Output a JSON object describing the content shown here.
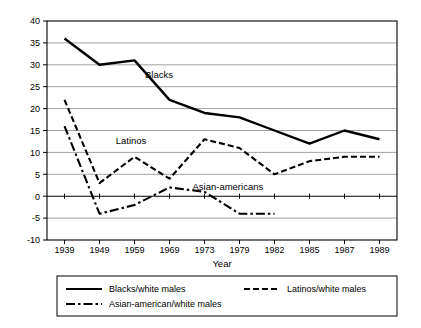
{
  "chart_data": {
    "type": "line",
    "title": "",
    "xlabel": "Year",
    "ylabel": "",
    "categories": [
      "1939",
      "1949",
      "1959",
      "1969",
      "1973",
      "1979",
      "1982",
      "1985",
      "1987",
      "1989"
    ],
    "x": [
      1939,
      1949,
      1959,
      1969,
      1973,
      1979,
      1982,
      1985,
      1987,
      1989
    ],
    "ylim": [
      -10,
      40
    ],
    "yticks": [
      -10,
      -5,
      0,
      5,
      10,
      15,
      20,
      25,
      30,
      35,
      40
    ],
    "ytick_labels": [
      "-10",
      "-5",
      "0",
      "5",
      "10",
      "15",
      "20",
      "25",
      "30",
      "35",
      "40"
    ],
    "grid": true,
    "legend_position": "bottom",
    "series": [
      {
        "name": "Blacks/white males",
        "short_name": "Blacks",
        "style": "solid",
        "color": "#000000",
        "values": [
          36,
          30,
          31,
          22,
          19,
          18,
          15,
          12,
          15,
          13
        ]
      },
      {
        "name": "Latinos/white males",
        "short_name": "Latinos",
        "style": "dashed",
        "color": "#000000",
        "values": [
          22,
          3,
          9,
          4,
          13,
          11,
          5,
          8,
          9,
          9
        ]
      },
      {
        "name": "Asian-american/white males",
        "short_name": "Asian-americans",
        "style": "dashdot",
        "color": "#000000",
        "values": [
          16,
          -4,
          -2,
          2,
          1,
          -4,
          -4,
          null,
          null,
          null
        ]
      }
    ],
    "annotations": [
      {
        "text": "Blacks",
        "x": 1966,
        "y": 27
      },
      {
        "text": "Latinos",
        "x": 1958,
        "y": 12
      },
      {
        "text": "Asian-americans",
        "x": 1977,
        "y": 1.5
      }
    ]
  },
  "legend": {
    "items": [
      {
        "label": "Blacks/white males",
        "style": "solid"
      },
      {
        "label": "Latinos/white males",
        "style": "dashed"
      },
      {
        "label": "Asian-american/white males",
        "style": "dashdot"
      }
    ]
  }
}
